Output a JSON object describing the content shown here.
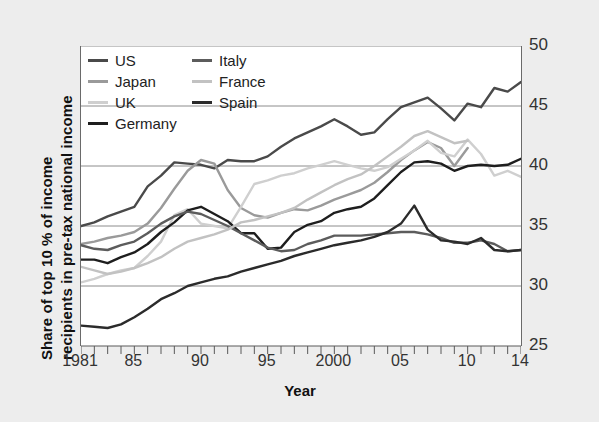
{
  "figure": {
    "background_color": "#ededed",
    "plot_background_color": "#ffffff"
  },
  "axes": {
    "ylabel_line1": "Share of top 10 % of income",
    "ylabel_line2": "recipients in pre-tax national income",
    "xlabel": "Year",
    "yticks": [
      "25",
      "30",
      "35",
      "40",
      "45",
      "50"
    ],
    "xticks": [
      "1981",
      "85",
      "90",
      "95",
      "2000",
      "05",
      "10",
      "14"
    ]
  },
  "legend": {
    "left_column": [
      {
        "label": "US",
        "color": "#4a4a4a"
      },
      {
        "label": "Japan",
        "color": "#9a9a9a"
      },
      {
        "label": "UK",
        "color": "#cfcfcf"
      },
      {
        "label": "Germany",
        "color": "#1e1e1e"
      }
    ],
    "right_column": [
      {
        "label": "Italy",
        "color": "#5c5c5c"
      },
      {
        "label": "France",
        "color": "#c2c2c2"
      },
      {
        "label": "Spain",
        "color": "#2b2b2b"
      }
    ]
  },
  "chart_data": {
    "type": "line",
    "title": "",
    "xlabel": "Year",
    "ylabel": "Share of top 10 % of income recipients in pre-tax national income",
    "xlim": [
      1981,
      2014
    ],
    "ylim": [
      25,
      50
    ],
    "ytick_values": [
      25,
      30,
      35,
      40,
      45,
      50
    ],
    "xtick_values": [
      1981,
      1985,
      1990,
      1995,
      2000,
      2005,
      2010,
      2014
    ],
    "xtick_labels": [
      "1981",
      "85",
      "90",
      "95",
      "2000",
      "05",
      "10",
      "14"
    ],
    "grid": "horizontal",
    "legend_position": "upper-left",
    "x": [
      1981,
      1982,
      1983,
      1984,
      1985,
      1986,
      1987,
      1988,
      1989,
      1990,
      1991,
      1992,
      1993,
      1994,
      1995,
      1996,
      1997,
      1998,
      1999,
      2000,
      2001,
      2002,
      2003,
      2004,
      2005,
      2006,
      2007,
      2008,
      2009,
      2010,
      2011,
      2012,
      2013,
      2014
    ],
    "series": [
      {
        "name": "US",
        "color": "#4a4a4a",
        "values": [
          35.0,
          35.3,
          35.8,
          36.2,
          36.6,
          38.3,
          39.2,
          40.3,
          40.2,
          40.1,
          39.8,
          40.5,
          40.4,
          40.4,
          40.8,
          41.6,
          42.3,
          42.8,
          43.3,
          43.9,
          43.3,
          42.6,
          42.8,
          43.9,
          44.9,
          45.3,
          45.7,
          44.8,
          43.8,
          45.2,
          44.9,
          46.5,
          46.2,
          47.0
        ]
      },
      {
        "name": "Japan",
        "color": "#9a9a9a",
        "values": [
          33.5,
          33.7,
          34.0,
          34.2,
          34.5,
          35.2,
          36.5,
          38.1,
          39.6,
          40.5,
          40.2,
          38.0,
          36.5,
          35.9,
          35.7,
          36.1,
          36.4,
          36.3,
          36.7,
          37.2,
          37.6,
          38.0,
          38.6,
          39.5,
          40.5,
          41.3,
          42.0,
          41.5,
          40.0,
          41.5,
          null,
          null,
          null,
          null
        ]
      },
      {
        "name": "UK",
        "color": "#cfcfcf",
        "values": [
          30.3,
          30.6,
          31.0,
          31.3,
          31.5,
          32.5,
          33.7,
          35.9,
          36.4,
          35.2,
          35.0,
          34.8,
          36.6,
          38.5,
          38.8,
          39.2,
          39.4,
          39.8,
          40.1,
          40.4,
          40.1,
          39.8,
          39.6,
          39.9,
          40.6,
          41.3,
          42.1,
          41.1,
          40.8,
          42.2,
          41.0,
          39.2,
          39.6,
          39.1
        ]
      },
      {
        "name": "Germany",
        "color": "#1e1e1e",
        "values": [
          32.2,
          32.2,
          31.9,
          32.4,
          32.8,
          33.5,
          34.5,
          35.3,
          36.3,
          36.6,
          36.0,
          35.4,
          34.4,
          34.4,
          33.1,
          33.2,
          34.5,
          35.1,
          35.4,
          36.1,
          36.4,
          36.6,
          37.3,
          38.4,
          39.5,
          40.3,
          40.4,
          40.2,
          39.6,
          40.0,
          40.1,
          40.0,
          40.1,
          40.6
        ]
      },
      {
        "name": "Italy",
        "color": "#5c5c5c",
        "values": [
          33.4,
          33.1,
          33.0,
          33.4,
          33.7,
          34.4,
          35.2,
          35.8,
          36.2,
          36.0,
          35.5,
          35.0,
          34.4,
          33.8,
          33.2,
          32.9,
          33.0,
          33.5,
          33.8,
          34.2,
          34.2,
          34.2,
          34.3,
          34.4,
          34.5,
          34.5,
          34.3,
          34.0,
          33.6,
          33.6,
          33.8,
          33.5,
          32.9,
          33.0
        ]
      },
      {
        "name": "France",
        "color": "#c2c2c2",
        "values": [
          31.6,
          31.3,
          31.0,
          31.2,
          31.5,
          31.9,
          32.4,
          33.1,
          33.7,
          34.0,
          34.3,
          34.7,
          35.3,
          35.5,
          35.8,
          36.1,
          36.5,
          37.2,
          37.8,
          38.4,
          38.9,
          39.3,
          40.0,
          40.8,
          41.6,
          42.5,
          42.9,
          42.4,
          41.9,
          42.1,
          null,
          null,
          null,
          null
        ]
      },
      {
        "name": "Spain",
        "color": "#2b2b2b",
        "values": [
          26.7,
          26.6,
          26.5,
          26.8,
          27.4,
          28.1,
          28.9,
          29.4,
          30.0,
          30.3,
          30.6,
          30.8,
          31.2,
          31.5,
          31.8,
          32.1,
          32.5,
          32.8,
          33.1,
          33.4,
          33.6,
          33.8,
          34.1,
          34.5,
          35.2,
          36.7,
          34.7,
          33.8,
          33.7,
          33.5,
          34.0,
          33.0,
          32.9,
          33.0
        ]
      }
    ]
  }
}
